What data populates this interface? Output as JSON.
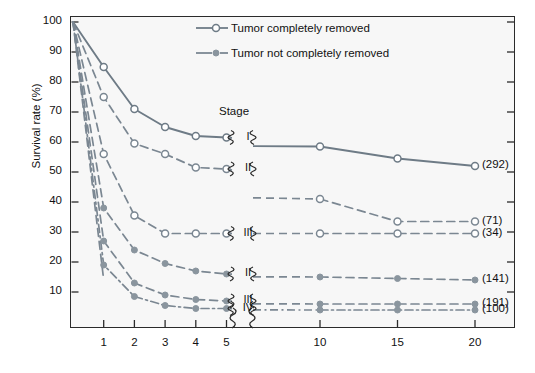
{
  "chart_data": {
    "type": "line",
    "title": "",
    "xlabel": "",
    "ylabel": "Survival rate (%)",
    "xlim": [
      0,
      20
    ],
    "ylim": [
      0,
      100
    ],
    "grid": false,
    "axis_break": {
      "after": 5,
      "before": 10,
      "label": "axis-break"
    },
    "x_ticks": [
      1,
      2,
      3,
      4,
      5,
      10,
      15,
      20
    ],
    "x_tick_labels": [
      "1",
      "2",
      "3",
      "4",
      "5",
      "10",
      "15",
      "20"
    ],
    "y_ticks": [
      10,
      20,
      30,
      40,
      50,
      60,
      70,
      80,
      90,
      100
    ],
    "y_tick_labels": [
      "10",
      "20",
      "30",
      "40",
      "50",
      "60",
      "70",
      "80",
      "90",
      "100"
    ],
    "legend_position": "top-right",
    "legend": [
      {
        "key": "completely-removed",
        "label": "Tumor completely removed",
        "marker": "open-circle",
        "line": "solid"
      },
      {
        "key": "not-completely-removed",
        "label": "Tumor not completely removed",
        "marker": "filled-circle",
        "line": "dashed"
      }
    ],
    "stage_header": "Stage",
    "series": [
      {
        "name": "Stage I, tumor completely removed",
        "stage": "I",
        "group": "completely-removed",
        "marker": "open-circle",
        "line": "solid",
        "n": "(292)",
        "x": [
          0,
          1,
          2,
          3,
          4,
          5,
          10,
          15,
          20
        ],
        "values": [
          100,
          85,
          71,
          65,
          62,
          61.5,
          58.5,
          54.5,
          52
        ]
      },
      {
        "name": "Stage II, tumor completely removed",
        "stage": "II",
        "group": "completely-removed",
        "marker": "open-circle",
        "line": "dashed",
        "n": "(71)",
        "x": [
          0,
          1,
          2,
          3,
          4,
          5,
          10,
          15,
          20
        ],
        "values": [
          100,
          75,
          59.5,
          56,
          51.5,
          51,
          41,
          33.5,
          33.5
        ]
      },
      {
        "name": "Stage III, tumor completely removed",
        "stage": "III",
        "group": "completely-removed",
        "marker": "open-circle",
        "line": "dashed",
        "n": "(34)",
        "x": [
          0,
          1,
          2,
          3,
          4,
          5,
          10,
          15,
          20
        ],
        "values": [
          100,
          56,
          35.5,
          29.5,
          29.5,
          29.5,
          29.5,
          29.5,
          29.5
        ]
      },
      {
        "name": "Stage II, tumor not completely removed",
        "stage": "II",
        "group": "not-completely-removed",
        "marker": "filled-circle",
        "line": "dashed",
        "n": "(141)",
        "x": [
          0,
          1,
          2,
          3,
          4,
          5,
          10,
          15,
          20
        ],
        "values": [
          100,
          38,
          24,
          19.5,
          17,
          16,
          15,
          14.5,
          14
        ]
      },
      {
        "name": "Stage III, tumor not completely removed",
        "stage": "III",
        "group": "not-completely-removed",
        "marker": "filled-circle",
        "line": "dashed",
        "n": "(191)",
        "x": [
          0,
          1,
          2,
          3,
          4,
          5,
          10,
          15,
          20
        ],
        "values": [
          100,
          27,
          13,
          9,
          7.5,
          7,
          6,
          6,
          6
        ]
      },
      {
        "name": "Stage IV, tumor not completely removed",
        "stage": "IV",
        "group": "not-completely-removed",
        "marker": "filled-circle",
        "line": "dash-dot",
        "n": "(100)",
        "x": [
          0,
          1,
          2,
          3,
          4,
          5,
          10,
          15,
          20
        ],
        "values": [
          100,
          19,
          8.5,
          5.5,
          4.5,
          4.5,
          4,
          4,
          4
        ]
      },
      {
        "name": "unlabeled steep curve A",
        "stage": "",
        "group": "not-completely-removed",
        "marker": "none",
        "line": "dashed",
        "n": "",
        "x": [
          0,
          1
        ],
        "values": [
          100,
          14
        ]
      }
    ],
    "stage_labels_right": [
      {
        "stage": "I",
        "at_y": 61.5
      },
      {
        "stage": "II",
        "at_y": 51
      },
      {
        "stage": "III",
        "at_y": 29.5
      },
      {
        "stage": "II",
        "at_y": 16
      },
      {
        "stage": "III",
        "at_y": 7
      },
      {
        "stage": "IV",
        "at_y": 4.5
      }
    ],
    "colors": {
      "line_solid": "#6e7b86",
      "line_dashed": "#7b8792",
      "marker_open_fill": "#ffffff",
      "marker_filled": "#8a959e",
      "axis": "#2b2b2b",
      "text": "#111111",
      "plot_background": "#f7f7f7",
      "page_background": "#ffffff"
    }
  }
}
